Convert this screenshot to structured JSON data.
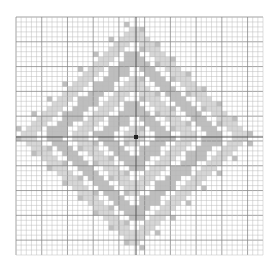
{
  "diagram": {
    "type": "grid-pattern",
    "grid": {
      "left": 16,
      "top": 17,
      "right": 263,
      "bottom": 255,
      "cells": 48,
      "minor_color": "#bdbdbd",
      "major_every": 5,
      "major_color": "#8a8a8a"
    },
    "axes": {
      "center_x": 136,
      "center_y": 137,
      "color": "#555555"
    },
    "pattern": {
      "shape": "diamond",
      "rings": 9,
      "fill_color": "#c8c8c8",
      "dark_fill_color": "#a8a8a8"
    },
    "center_dot": {
      "color": "#222222",
      "size": 4
    }
  }
}
